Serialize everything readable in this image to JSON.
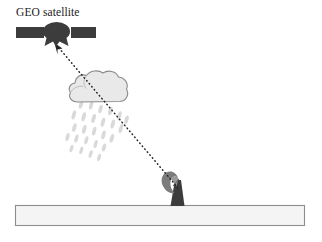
{
  "figure": {
    "background_color": "#ffffff"
  },
  "labels": {
    "satellite": "GEO satellite"
  },
  "elements": {
    "satellite": {
      "name": "geo-satellite",
      "body_color": "#3c3c3c",
      "panel_color": "#3c3c3c",
      "left_panel": {
        "x": 16,
        "y": 27,
        "w": 28,
        "h": 11
      },
      "right_panel": {
        "x": 71,
        "y": 27,
        "w": 25,
        "h": 11
      },
      "body_cx": 57,
      "body_cy": 32,
      "body_rx": 13,
      "body_ry": 9
    },
    "cloud": {
      "name": "rain-cloud",
      "fill_color": "#e9e9e9",
      "stroke_color": "#8d8d8d",
      "x": 70,
      "y": 72,
      "w": 58,
      "h": 30
    },
    "rain": {
      "name": "rain-drops",
      "color": "#d6d6d6",
      "drop_count": 26,
      "area": {
        "x": 72,
        "y": 104,
        "w": 52,
        "h": 42
      }
    },
    "ground_rect": {
      "name": "ground-surface",
      "fill_color": "#f4f4f4",
      "stroke_color": "#8d8d8d",
      "x": 15,
      "y": 205,
      "w": 290,
      "h": 21
    },
    "antenna": {
      "name": "ground-station-antenna",
      "dish_color": "#7a7a7a",
      "mast_color": "#3c3c3c",
      "x": 165,
      "y": 176,
      "w": 22,
      "h": 30
    },
    "signal_path": {
      "name": "signal-path",
      "color": "#262626",
      "style": "dotted",
      "from": {
        "x": 178,
        "y": 188
      },
      "to": {
        "x": 56,
        "y": 45
      },
      "arrow_at": "satellite"
    }
  }
}
